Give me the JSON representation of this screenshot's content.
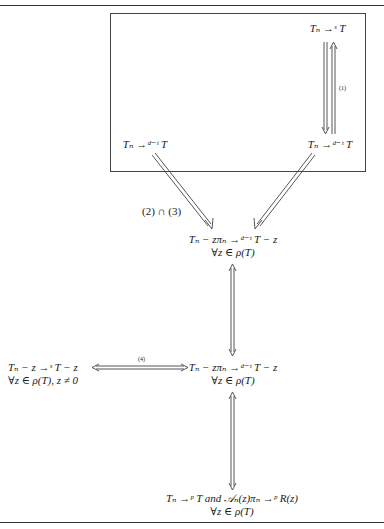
{
  "diagram": {
    "nodes": {
      "top_right": {
        "line1": "Tₙ →ˢ T"
      },
      "box_left": {
        "line1": "Tₙ →ᵈ⁻ᵗ T"
      },
      "box_right": {
        "line1": "Tₙ →ᵈ⁻ᵗ T"
      },
      "center": {
        "line1": "Tₙ − zπₙ →ᵈ⁻ᵗ T − z",
        "line2": "∀z ∈ ρ(T)"
      },
      "middle_left": {
        "line1": "Tₙ − z →ˢ T − z",
        "line2": "∀z ∈ ρ(T), z ≠ 0"
      },
      "middle_center": {
        "line1": "Tₙ − zπₙ →ᵈ⁻ᵗ T − z",
        "line2": "∀z ∈ ρ(T)"
      },
      "bottom": {
        "line1": "Tₙ →ᵖ T and 𝒜ₙ(z)πₙ →ᵖ R(z)",
        "line2": "∀z ∈ ρ(T)"
      }
    },
    "edge_labels": {
      "e1": "(1)",
      "e23": "(2) ∩ (3)",
      "e4": "(4)"
    },
    "edges": [
      {
        "from": "top_right",
        "to": "box_right",
        "type": "implies",
        "label": ""
      },
      {
        "from": "box_right",
        "to": "top_right",
        "type": "implies",
        "label": "(1)"
      },
      {
        "from": "box_left",
        "to": "center",
        "type": "implies",
        "label": "(2) ∩ (3)"
      },
      {
        "from": "box_right",
        "to": "center",
        "type": "implies",
        "label": ""
      },
      {
        "from": "center",
        "to": "middle_center",
        "type": "iff",
        "label": ""
      },
      {
        "from": "middle_left",
        "to": "middle_center",
        "type": "iff",
        "label": "(4)"
      },
      {
        "from": "middle_center",
        "to": "bottom",
        "type": "iff",
        "label": ""
      }
    ]
  }
}
